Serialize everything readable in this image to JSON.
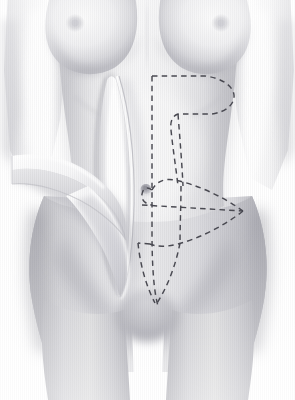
{
  "image": {
    "title": "Abdominoplasty surgical planning illustration",
    "subject": "female-torso-anterior-view",
    "style": "grayscale-medical-diagram",
    "width": 295,
    "height": 400
  },
  "palette": {
    "background": "#ffffff",
    "skin_light": "#f2f2f3",
    "skin_mid": "#dcdcdf",
    "skin_shadow": "#b9b9bf",
    "skin_deep_shadow": "#a6a6ad",
    "highlight": "#ffffff",
    "marking_line": "#4a4a52",
    "areola": "#d2d2d6",
    "navel": "#9a9aa2"
  },
  "anatomy": {
    "parts": [
      {
        "name": "torso",
        "label": "Torso"
      },
      {
        "name": "left-breast",
        "label": "Left breast"
      },
      {
        "name": "right-breast",
        "label": "Right breast"
      },
      {
        "name": "left-areola",
        "label": "Left areola"
      },
      {
        "name": "right-areola",
        "label": "Right areola"
      },
      {
        "name": "left-arm",
        "label": "Left arm"
      },
      {
        "name": "right-arm",
        "label": "Right arm"
      },
      {
        "name": "abdomen",
        "label": "Abdomen"
      },
      {
        "name": "navel",
        "label": "Navel / umbilicus"
      },
      {
        "name": "left-hip",
        "label": "Left hip"
      },
      {
        "name": "right-hip",
        "label": "Right hip"
      },
      {
        "name": "pubic-region",
        "label": "Pubic region"
      },
      {
        "name": "left-thigh",
        "label": "Left thigh"
      },
      {
        "name": "right-thigh",
        "label": "Right thigh"
      }
    ]
  },
  "surgical": {
    "incision": {
      "name": "vertical-midline-incision",
      "label": "Vertical paramedian incision",
      "orientation": "vertical",
      "highlight_color": "#ffffff"
    },
    "flap": {
      "name": "raised-tissue-flap",
      "label": "Elevated tissue flap",
      "direction": "lifted-to-patient-right-viewer-left"
    },
    "markings": [
      {
        "name": "upper-marking",
        "label": "Upper resection marking",
        "shape": "wing-curve",
        "line_style": "dashed"
      },
      {
        "name": "lower-marking",
        "label": "Lower resection marking",
        "shape": "pointed-oval",
        "line_style": "dashed"
      },
      {
        "name": "vertical-midline-marking",
        "label": "Vertical midline guide",
        "shape": "straight-line",
        "line_style": "dashed"
      },
      {
        "name": "horizontal-guide-marking",
        "label": "Horizontal guide line",
        "shape": "straight-line",
        "line_style": "dashed"
      }
    ]
  }
}
